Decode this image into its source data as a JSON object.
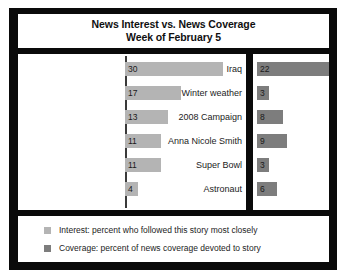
{
  "title": {
    "line1": "News Interest vs. News Coverage",
    "line2": "Week of February 5"
  },
  "legend": {
    "interest": {
      "label": "Interest: percent who followed this story most closely",
      "color": "#b4b4b4"
    },
    "coverage": {
      "label": "Coverage: percent of news coverage devoted to story",
      "color": "#7d7d7d"
    }
  },
  "chart_data": {
    "type": "bar",
    "title": "News Interest vs. News Coverage Week of February 5",
    "subtitle": "Week of February 5",
    "orientation": "horizontal",
    "xlabel": "",
    "ylabel": "",
    "xlim": [
      0,
      30
    ],
    "grid": false,
    "legend_position": "bottom",
    "categories": [
      "Iraq",
      "Winter weather",
      "2008 Campaign",
      "Anna Nicole Smith",
      "Super Bowl",
      "Astronaut"
    ],
    "series": [
      {
        "name": "Interest: percent who followed this story most closely",
        "short_name": "Interest",
        "color": "#b4b4b4",
        "values": [
          30,
          17,
          13,
          11,
          11,
          4
        ]
      },
      {
        "name": "Coverage: percent of news coverage devoted to story",
        "short_name": "Coverage",
        "color": "#7d7d7d",
        "values": [
          22,
          3,
          8,
          9,
          3,
          6
        ]
      }
    ]
  }
}
